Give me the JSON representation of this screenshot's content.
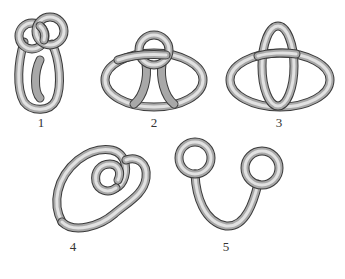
{
  "figure": {
    "tube_colors": {
      "outline": "#3a3a3a",
      "body": "#a8a8a8",
      "highlight": "#e2e2e2"
    },
    "items": [
      {
        "label": "1",
        "label_pos": [
          41,
          116
        ]
      },
      {
        "label": "2",
        "label_pos": [
          154,
          116
        ]
      },
      {
        "label": "3",
        "label_pos": [
          279,
          116
        ]
      },
      {
        "label": "4",
        "label_pos": [
          73,
          240
        ]
      },
      {
        "label": "5",
        "label_pos": [
          226,
          240
        ]
      }
    ]
  }
}
